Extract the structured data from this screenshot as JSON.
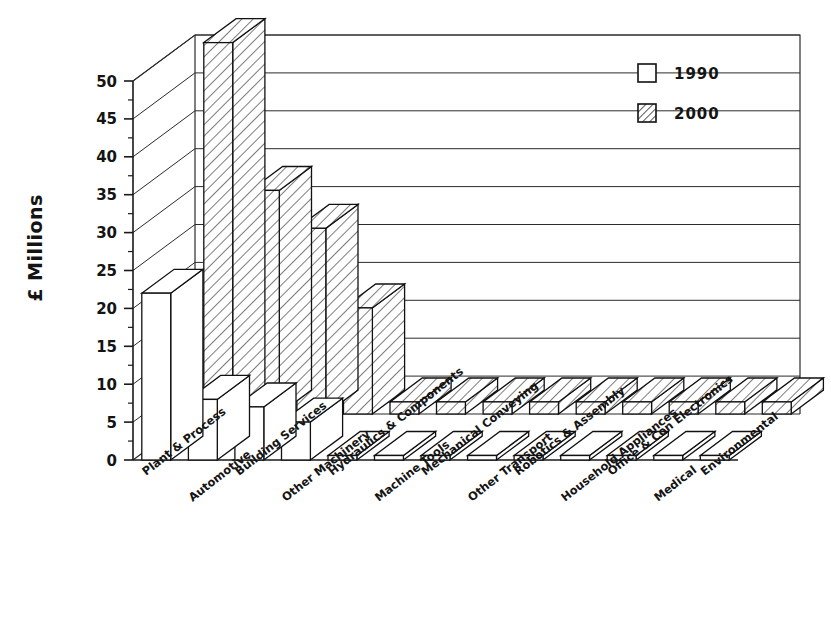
{
  "chart_data": {
    "type": "bar",
    "title": "",
    "xlabel": "",
    "ylabel": "£ Millions",
    "ylim": [
      0,
      50
    ],
    "yticks": [
      0,
      5,
      10,
      15,
      20,
      25,
      30,
      35,
      40,
      45,
      50
    ],
    "ytick_labels": [
      "0",
      "5",
      "10",
      "15",
      "20",
      "25",
      "30",
      "35",
      "40",
      "45",
      "50"
    ],
    "grid": true,
    "legend_position": "top-right",
    "projection": "3d-bar",
    "categories": [
      "Plant & Process",
      "Automotive",
      "Building Services",
      "Other Machinery",
      "Hydraulics & Components",
      "Machine Tools",
      "Mechanical Conveying",
      "Other Transport",
      "Robotics & Assembly",
      "Household Appliances",
      "Office & Con Electronics",
      "Medical",
      "Environmental"
    ],
    "series": [
      {
        "name": "1990",
        "fill": "empty",
        "values": [
          22,
          8,
          7,
          5,
          0.6,
          0.6,
          0.6,
          0.6,
          0.6,
          0.6,
          0.6,
          0.6,
          0.6
        ]
      },
      {
        "name": "2000",
        "fill": "hatched",
        "values": [
          49,
          29.5,
          24.5,
          14,
          1.6,
          1.6,
          1.6,
          1.6,
          1.6,
          1.6,
          1.6,
          1.6,
          1.6
        ]
      }
    ]
  },
  "legend": {
    "entries": [
      {
        "label": "1990",
        "swatch": "empty-square"
      },
      {
        "label": "2000",
        "swatch": "hatched-square"
      }
    ]
  },
  "colors": {
    "background": "#ffffff",
    "ink": "#111111",
    "grid": "#2b2b2b"
  }
}
